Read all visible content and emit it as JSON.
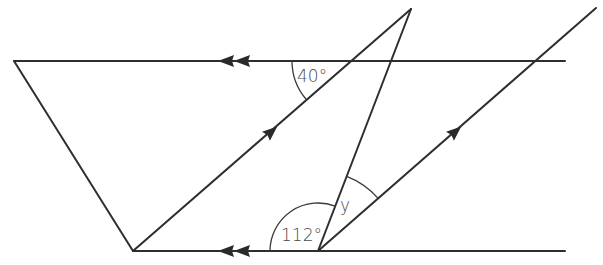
{
  "diagram": {
    "stroke_color": "#2e2e2e",
    "label_color": "#4a4a4a",
    "points": {
      "top_left": [
        14,
        61
      ],
      "bottom_left": [
        133,
        251
      ],
      "apex": [
        411,
        9
      ],
      "bottom_mid": [
        318,
        251
      ],
      "top_right_end": [
        596,
        8
      ],
      "top_line_end": [
        565,
        61
      ],
      "bottom_line_end": [
        565,
        251
      ]
    },
    "parallel_marks": {
      "top_line": "double-arrow-left",
      "bottom_line": "double-arrow-left",
      "left_diagonal": "single-arrow-up-right",
      "right_diagonal": "single-arrow-up-right"
    },
    "angles": {
      "top": {
        "label": "40°",
        "value": 40
      },
      "bottom": {
        "label": "112°",
        "value": 112
      },
      "unknown": {
        "label": "y",
        "value": null
      }
    }
  }
}
